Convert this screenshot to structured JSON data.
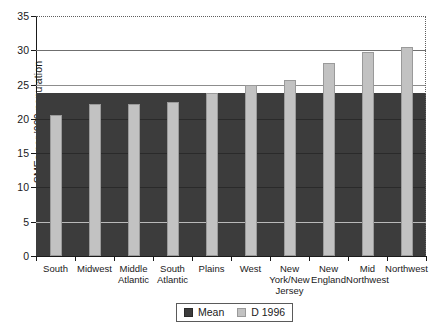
{
  "chart_data": {
    "type": "bar",
    "title": "",
    "xlabel": "",
    "ylabel": "SMEs per '000 population",
    "ylim": [
      0,
      35
    ],
    "yticks": [
      0,
      5,
      10,
      15,
      20,
      25,
      30,
      35
    ],
    "ytick_labels": [
      "0",
      "5",
      "10",
      "15",
      "20",
      "25",
      "30",
      "35"
    ],
    "grid": true,
    "legend_position": "bottom-center",
    "categories": [
      "South",
      "Midwest",
      "Middle\nAtlantic",
      "South\nAtlantic",
      "Plains",
      "West",
      "New\nYork/New\nJersey",
      "New\nEngland",
      "Mid\nNorthwest",
      "Northwest"
    ],
    "series": [
      {
        "name": "D 1996",
        "type": "bar",
        "color": "#c2c2c2",
        "values": [
          20.5,
          22.1,
          22.2,
          22.4,
          23.8,
          25.0,
          25.6,
          28.2,
          29.7,
          30.5
        ]
      },
      {
        "name": "Mean",
        "type": "band",
        "color": "#3c3c3c",
        "value": 23.8
      }
    ],
    "annotations": []
  },
  "legend": {
    "items": [
      {
        "label": "Mean",
        "swatch": "mean-swatch"
      },
      {
        "label": "D 1996",
        "swatch": "d1996-swatch"
      }
    ]
  },
  "colors": {
    "bar_fill": "#c2c2c2",
    "bar_border": "#9a9a9a",
    "mean_band": "#3c3c3c",
    "axis": "#1a1a1a",
    "gridline": "#8d8d8d",
    "background": "#ffffff"
  }
}
